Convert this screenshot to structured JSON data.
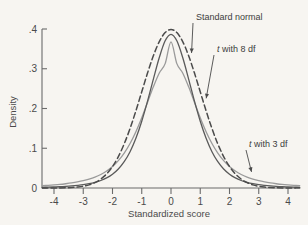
{
  "chart_data": {
    "type": "line",
    "title": "",
    "subtitle": "",
    "xlabel": "Standardized score",
    "ylabel": "Density",
    "xlim": [
      -4.4,
      4.4
    ],
    "ylim": [
      0,
      0.425
    ],
    "xticks": [
      -4,
      -3,
      -2,
      -1,
      0,
      1,
      2,
      3,
      4
    ],
    "xtick_labels": [
      "-4",
      "-3",
      "-2",
      "-1",
      "0",
      "1",
      "2",
      "3",
      "4"
    ],
    "yticks": [
      0,
      0.1,
      0.2,
      0.3,
      0.4
    ],
    "ytick_labels": [
      "0",
      ".1",
      ".2",
      ".3",
      ".4"
    ],
    "grid": false,
    "legend": "none",
    "annotations": [
      {
        "id": "standard-normal",
        "text": "Standard normal",
        "text_italic_prefix": "",
        "points_to_x": 0.6,
        "points_to_y": 0.332
      },
      {
        "id": "t-8-df",
        "text": " with 8 df",
        "text_italic_prefix": "t",
        "points_to_x": 1.1,
        "points_to_y": 0.218
      },
      {
        "id": "t-3-df",
        "text": " with 3 df",
        "text_italic_prefix": "t",
        "points_to_x": 2.65,
        "points_to_y": 0.033
      }
    ],
    "series": [
      {
        "name": "Standard normal",
        "style": "dashed",
        "color": "#4b4b4b",
        "peak": 0.399,
        "x": [
          -4.4,
          -4.2,
          -4,
          -3.8,
          -3.6,
          -3.4,
          -3.2,
          -3,
          -2.8,
          -2.6,
          -2.4,
          -2.2,
          -2,
          -1.8,
          -1.6,
          -1.4,
          -1.2,
          -1,
          -0.8,
          -0.6,
          -0.4,
          -0.2,
          0,
          0.2,
          0.4,
          0.6,
          0.8,
          1,
          1.2,
          1.4,
          1.6,
          1.8,
          2,
          2.2,
          2.4,
          2.6,
          2.8,
          3,
          3.2,
          3.4,
          3.6,
          3.8,
          4,
          4.2,
          4.4
        ],
        "y": [
          0.0,
          0.0001,
          0.0001,
          0.0003,
          0.0006,
          0.0012,
          0.0024,
          0.0044,
          0.0079,
          0.0136,
          0.0224,
          0.0355,
          0.054,
          0.079,
          0.1109,
          0.1497,
          0.1942,
          0.242,
          0.2897,
          0.3332,
          0.3683,
          0.391,
          0.3989,
          0.391,
          0.3683,
          0.3332,
          0.2897,
          0.242,
          0.1942,
          0.1497,
          0.1109,
          0.079,
          0.054,
          0.0355,
          0.0224,
          0.0136,
          0.0079,
          0.0044,
          0.0024,
          0.0012,
          0.0006,
          0.0003,
          0.0001,
          0.0001,
          0.0
        ]
      },
      {
        "name": "t with 8 df",
        "style": "solid",
        "color": "#5a5a5a",
        "peak": 0.387,
        "x": [
          -4.4,
          -4.2,
          -4,
          -3.8,
          -3.6,
          -3.4,
          -3.2,
          -3,
          -2.8,
          -2.6,
          -2.4,
          -2.2,
          -2,
          -1.8,
          -1.6,
          -1.4,
          -1.2,
          -1,
          -0.8,
          -0.6,
          -0.4,
          -0.2,
          0,
          0.2,
          0.4,
          0.6,
          0.8,
          1,
          1.2,
          1.4,
          1.6,
          1.8,
          2,
          2.2,
          2.4,
          2.6,
          2.8,
          3,
          3.2,
          3.4,
          3.6,
          3.8,
          4,
          4.2,
          4.4
        ],
        "y": [
          0.0017,
          0.0021,
          0.0026,
          0.0032,
          0.004,
          0.0051,
          0.0065,
          0.0083,
          0.0108,
          0.0142,
          0.0189,
          0.0255,
          0.0348,
          0.0479,
          0.0662,
          0.0914,
          0.1251,
          0.168,
          0.2191,
          0.2747,
          0.3282,
          0.3703,
          0.3867,
          0.3703,
          0.3282,
          0.2747,
          0.2191,
          0.168,
          0.1251,
          0.0914,
          0.0662,
          0.0479,
          0.0348,
          0.0255,
          0.0189,
          0.0142,
          0.0108,
          0.0083,
          0.0065,
          0.0051,
          0.004,
          0.0032,
          0.0026,
          0.0021,
          0.0017
        ]
      },
      {
        "name": "t with 3 df",
        "style": "solid",
        "color": "#9a9a9a",
        "peak": 0.368,
        "x": [
          -4.4,
          -4.2,
          -4,
          -3.8,
          -3.6,
          -3.4,
          -3.2,
          -3,
          -2.8,
          -2.6,
          -2.4,
          -2.2,
          -2,
          -1.8,
          -1.6,
          -1.4,
          -1.2,
          -1,
          -0.8,
          -0.6,
          -0.4,
          -0.2,
          0,
          0.2,
          0.4,
          0.6,
          0.8,
          1,
          1.2,
          1.4,
          1.6,
          1.8,
          2,
          2.2,
          2.4,
          2.6,
          2.8,
          3,
          3.2,
          3.4,
          3.6,
          3.8,
          4,
          4.2,
          4.4
        ],
        "y": [
          0.0057,
          0.0066,
          0.0077,
          0.009,
          0.0107,
          0.0127,
          0.0152,
          0.0183,
          0.0223,
          0.0274,
          0.034,
          0.0426,
          0.054,
          0.0688,
          0.0878,
          0.1119,
          0.1416,
          0.1768,
          0.2159,
          0.2551,
          0.2893,
          0.3129,
          0.3676,
          0.3129,
          0.2893,
          0.2551,
          0.2159,
          0.1768,
          0.1416,
          0.1119,
          0.0878,
          0.0688,
          0.054,
          0.0426,
          0.034,
          0.0274,
          0.0223,
          0.0183,
          0.0152,
          0.0127,
          0.0107,
          0.009,
          0.0077,
          0.0066,
          0.0057
        ]
      }
    ]
  },
  "figure": {
    "background_color": "#f7f5f1",
    "axis_color": "#6b6b6b"
  }
}
